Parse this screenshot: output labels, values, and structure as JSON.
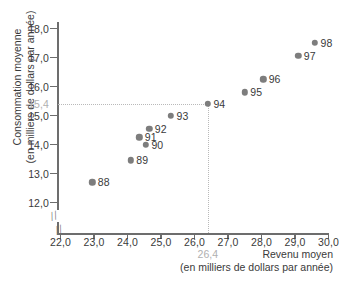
{
  "chart_data": {
    "type": "scatter",
    "title": "",
    "xlabel": "Revenu moyen (en milliers de dollars par année)",
    "ylabel": "Consommation moyenne (en milliers de dollars par année)",
    "xlabel_line1": "Revenu moyen",
    "xlabel_line2": "(en milliers de dollars par année)",
    "ylabel_line1": "Consommation moyenne",
    "ylabel_line2": "(en milliers de dollars par année)",
    "xlim": [
      22.0,
      30.0
    ],
    "ylim": [
      11.6,
      18.4
    ],
    "xticks": [
      "22,0",
      "23,0",
      "24,0",
      "25,0",
      "26,0",
      "27,0",
      "28,0",
      "29,0",
      "30,0"
    ],
    "xtick_values": [
      22.0,
      23.0,
      24.0,
      25.0,
      26.0,
      27.0,
      28.0,
      29.0,
      30.0
    ],
    "yticks": [
      "12,0",
      "13,0",
      "14,0",
      "15,0",
      "16,0",
      "17,0",
      "18,0"
    ],
    "ytick_values": [
      12.0,
      13.0,
      14.0,
      15.0,
      16.0,
      17.0,
      18.0
    ],
    "grid": false,
    "legend": "none",
    "axis_break_x": true,
    "axis_break_y": true,
    "point_color": "#7d7d7d",
    "guide_color": "#b9b9b9",
    "highlight_color": "#b0b0b0",
    "points": [
      {
        "label": "88",
        "x": 22.95,
        "y": 12.7
      },
      {
        "label": "89",
        "x": 24.1,
        "y": 13.45
      },
      {
        "label": "90",
        "x": 24.55,
        "y": 13.98
      },
      {
        "label": "91",
        "x": 24.35,
        "y": 14.25
      },
      {
        "label": "92",
        "x": 24.65,
        "y": 14.55
      },
      {
        "label": "93",
        "x": 25.3,
        "y": 15.0
      },
      {
        "label": "94",
        "x": 26.4,
        "y": 15.4
      },
      {
        "label": "95",
        "x": 27.5,
        "y": 15.8
      },
      {
        "label": "96",
        "x": 28.05,
        "y": 16.25
      },
      {
        "label": "97",
        "x": 29.1,
        "y": 17.05
      },
      {
        "label": "98",
        "x": 29.6,
        "y": 17.5
      }
    ],
    "annotations": [
      {
        "name": "y-reference",
        "text": "15,4",
        "axis": "y",
        "value": 15.4
      },
      {
        "name": "x-reference",
        "text": "26,4",
        "axis": "x",
        "value": 26.4
      }
    ],
    "reference_lines": {
      "horizontal_y": 15.4,
      "vertical_x": 26.4,
      "style": "dotted",
      "intersect_point": "94"
    }
  }
}
